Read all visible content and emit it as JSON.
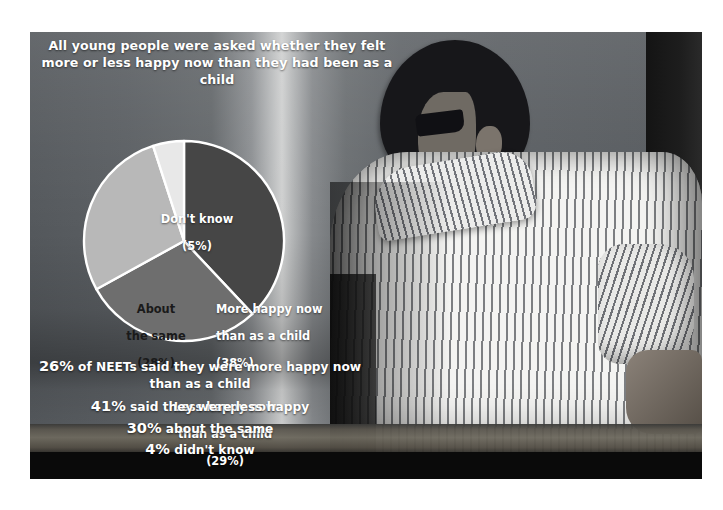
{
  "title": "All young people were asked whether they felt more or less happy now than they had been as a child",
  "chart_data": {
    "type": "pie",
    "title": "All young people were asked whether they felt more or less happy now than they had been as a child",
    "xlabel": "",
    "ylabel": "",
    "legend_position": "inside-slices",
    "grid": false,
    "categories": [
      "More happy now than as a child",
      "Less happy now than as a child",
      "About the same",
      "Don't know"
    ],
    "values": [
      38,
      29,
      28,
      5
    ],
    "unit": "%",
    "slices": [
      {
        "label": "More happy now\nthan as a child",
        "label_line1": "More happy now",
        "label_line2": "than as a child",
        "percent_text": "(38%)",
        "value": 38,
        "color": "#464646",
        "text_color": "#ffffff"
      },
      {
        "label": "Less happy now\nthan as a child",
        "label_line1": "Less happy now",
        "label_line2": "than as a child",
        "percent_text": "(29%)",
        "value": 29,
        "color": "#6e6e6e",
        "text_color": "#ffffff"
      },
      {
        "label": "About\nthe same",
        "label_line1": "About",
        "label_line2": "the same",
        "percent_text": "(28%)",
        "value": 28,
        "color": "#b8b8b8",
        "text_color": "#1a1a1a"
      },
      {
        "label": "Don't know",
        "label_line1": "Don't know",
        "label_line2": "",
        "percent_text": "(5%)",
        "value": 5,
        "color": "#e8e8e8",
        "text_color": "#ffffff"
      }
    ]
  },
  "stats": {
    "lines": [
      {
        "pct": "26%",
        "rest": " of NEETs said they were more happy now than as a child"
      },
      {
        "pct": "41%",
        "rest": " said they were less happy"
      },
      {
        "pct": "30%",
        "rest": " about the same"
      },
      {
        "pct": "4%",
        "rest": " didn't know"
      }
    ]
  },
  "colors": {
    "slice_more": "#464646",
    "slice_less": "#6e6e6e",
    "slice_same": "#b8b8b8",
    "slice_dontknow": "#e8e8e8",
    "slice_border": "#ffffff",
    "text_light": "#ffffff",
    "text_dark": "#1a1a1a",
    "photo_background": "#5a5d60",
    "page_background": "#ffffff"
  }
}
